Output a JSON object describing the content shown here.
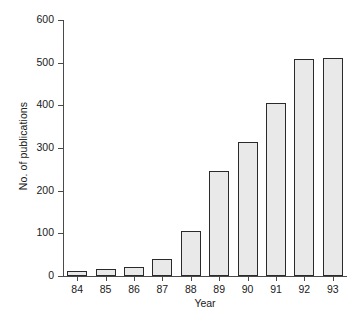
{
  "chart_data": {
    "type": "bar",
    "title": "",
    "subtitle": "",
    "xlabel": "Year",
    "ylabel": "No. of publications",
    "categories": [
      "84",
      "85",
      "86",
      "87",
      "88",
      "89",
      "90",
      "91",
      "92",
      "93"
    ],
    "values": [
      12,
      17,
      20,
      40,
      105,
      245,
      315,
      405,
      508,
      512
    ],
    "series": [
      {
        "name": "No. of publications",
        "values": [
          12,
          17,
          20,
          40,
          105,
          245,
          315,
          405,
          508,
          512
        ]
      }
    ],
    "ylim": [
      0,
      600
    ],
    "yticks": [
      "0",
      "100",
      "200",
      "300",
      "400",
      "500",
      "600"
    ],
    "ytick_values": [
      0,
      100,
      200,
      300,
      400,
      500,
      600
    ],
    "grid": false,
    "legend": false,
    "legend_position": "none",
    "bar_fill_color": "#e9e9e9",
    "bar_edge_color": "#2a2a2a",
    "axis_color": "#4a4a4a",
    "background_color": "#ffffff"
  }
}
